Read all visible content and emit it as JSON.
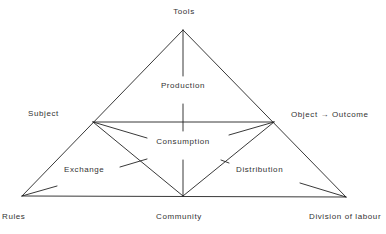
{
  "diagram": {
    "title_fragment": "g",
    "nodes": {
      "tools": "Tools",
      "subject": "Subject",
      "object_outcome": "Object → Outcome",
      "rules": "Rules",
      "community": "Community",
      "division_of_labour": "Division of labour"
    },
    "processes": {
      "production": "Production",
      "consumption": "Consumption",
      "exchange": "Exchange",
      "distribution": "Distribution"
    },
    "colors": {
      "line": "#222222",
      "text": "#333333",
      "background": "#ffffff"
    }
  }
}
